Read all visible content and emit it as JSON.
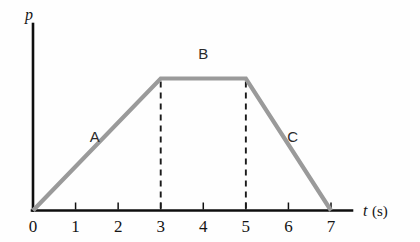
{
  "figure": {
    "background_color": "#fefefe",
    "curve_color": "#9a9a9a",
    "axis_color": "#0e0e0e",
    "dash_color": "#1a1a1a",
    "y_axis_label": "p",
    "x_axis_label_symbol": "t",
    "x_axis_label_unit": "(s)",
    "segment_labels": [
      {
        "text": "A",
        "t": 1.45,
        "p": 0.52
      },
      {
        "text": "B",
        "t": 4.0,
        "p": 1.15
      },
      {
        "text": "C",
        "t": 6.1,
        "p": 0.52
      }
    ],
    "dashed_guides": [
      3,
      5
    ]
  },
  "chart_data": {
    "type": "line",
    "title": "",
    "xlabel": "t (s)",
    "ylabel": "p",
    "x": [
      0,
      3,
      5,
      7
    ],
    "values": [
      0,
      1,
      1,
      0
    ],
    "series": [
      {
        "name": "p(t)",
        "values": [
          0,
          1,
          1,
          0
        ]
      }
    ],
    "xlim": [
      0,
      7.45
    ],
    "ylim": [
      0,
      1.42
    ],
    "xticks": [
      0,
      1,
      2,
      3,
      4,
      5,
      6,
      7
    ],
    "xtick_labels": [
      "0",
      "1",
      "2",
      "3",
      "4",
      "5",
      "6",
      "7"
    ],
    "yticks": [],
    "ytick_labels": [],
    "grid": false,
    "legend": null,
    "annotations": [
      {
        "label": "A",
        "description": "rising segment from t=0 to t=3"
      },
      {
        "label": "B",
        "description": "constant plateau from t=3 to t=5"
      },
      {
        "label": "C",
        "description": "falling segment from t=5 to t=7"
      }
    ]
  }
}
